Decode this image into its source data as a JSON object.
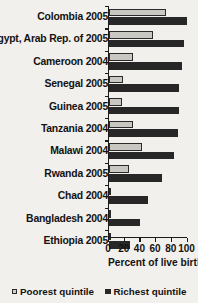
{
  "chart_data": {
    "type": "bar",
    "orientation": "horizontal",
    "title": "",
    "xlabel": "Percent of live births",
    "ylabel": "",
    "xlim": [
      0,
      100
    ],
    "xticks": [
      0,
      20,
      40,
      60,
      80,
      100
    ],
    "grid": false,
    "legend_position": "bottom",
    "categories": [
      "Colombia 2005",
      "Egypt, Arab Rep. of 2005",
      "Cameroon 2004",
      "Senegal 2005",
      "Guinea 2005",
      "Tanzania 2004",
      "Malawi 2004",
      "Rwanda 2005",
      "Chad 2004",
      "Bangladesh 2004",
      "Ethiopia 2005"
    ],
    "series": [
      {
        "name": "Poorest quintile",
        "color": "#c9c7c2",
        "values": [
          73,
          56,
          30,
          18,
          17,
          31,
          42,
          25,
          2,
          3,
          1
        ]
      },
      {
        "name": "Richest quintile",
        "color": "#272727",
        "values": [
          99,
          96,
          93,
          89,
          89,
          88,
          83,
          68,
          50,
          40,
          27
        ]
      }
    ]
  },
  "legend": {
    "items": [
      {
        "label": "Poorest quintile",
        "swatch": "poorest"
      },
      {
        "label": "Richest quintile",
        "swatch": "richest"
      }
    ]
  }
}
